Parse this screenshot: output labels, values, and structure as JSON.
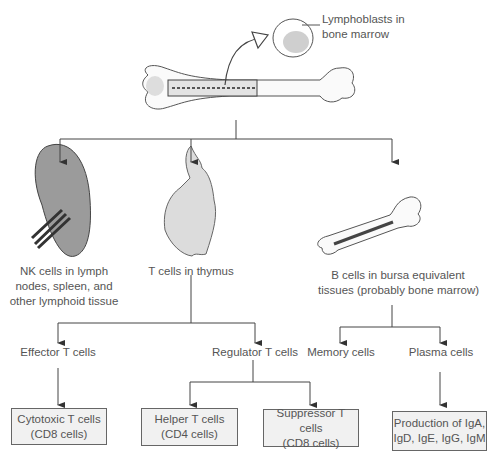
{
  "diagram": {
    "top": {
      "callout": [
        "Lymphoblasts in",
        "bone marrow"
      ]
    },
    "level1": [
      {
        "label": [
          "NK cells in lymph",
          "nodes, spleen, and",
          "other lymphoid tissue"
        ],
        "icon": "spleen"
      },
      {
        "label": [
          "T cells in thymus"
        ],
        "icon": "thymus"
      },
      {
        "label": [
          "B cells in bursa equivalent",
          "tissues (probably bone marrow)"
        ],
        "icon": "bone"
      }
    ],
    "t_branch": {
      "effector": "Effector T cells",
      "regulator": "Regulator T cells",
      "boxes": [
        [
          "Cytotoxic T cells",
          "(CD8 cells)"
        ],
        [
          "Helper T cells",
          "(CD4 cells)"
        ],
        [
          "Suppressor T cells",
          "(CD8 cells)"
        ]
      ]
    },
    "b_branch": {
      "memory": "Memory cells",
      "plasma": "Plasma cells",
      "box": [
        "Production of IgA,",
        "IgD, IgE, IgG, IgM"
      ]
    }
  }
}
